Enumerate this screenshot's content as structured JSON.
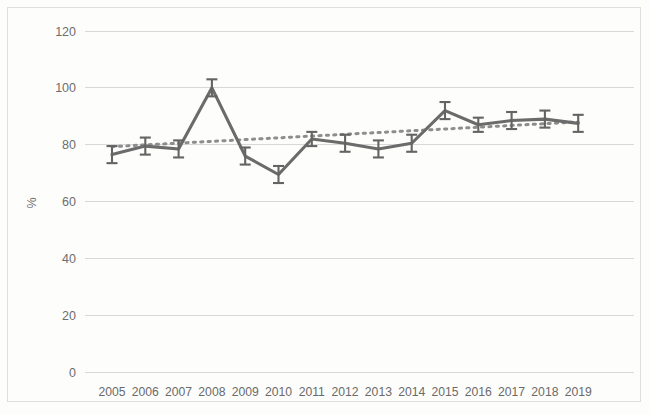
{
  "chart_data": {
    "type": "line",
    "title": "",
    "xlabel": "",
    "ylabel": "%",
    "categories": [
      "2005",
      "2006",
      "2007",
      "2008",
      "2009",
      "2010",
      "2011",
      "2012",
      "2013",
      "2014",
      "2015",
      "2016",
      "2017",
      "2018",
      "2019"
    ],
    "series": [
      {
        "name": "Observed value",
        "values": [
          76.5,
          79.5,
          78.5,
          100.0,
          76.0,
          69.5,
          82.0,
          80.5,
          78.5,
          80.5,
          92.0,
          87.0,
          88.5,
          89.0,
          87.5
        ],
        "error_low": [
          73.5,
          76.5,
          75.5,
          97.0,
          73.0,
          66.5,
          79.5,
          77.5,
          75.5,
          77.5,
          89.0,
          84.5,
          85.5,
          86.0,
          84.5
        ],
        "error_high": [
          79.5,
          82.5,
          81.5,
          103.0,
          79.0,
          72.5,
          84.5,
          83.5,
          81.5,
          83.5,
          95.0,
          89.5,
          91.5,
          92.0,
          90.5
        ],
        "color": "#6b6b6b",
        "style": "solid-with-error-bars"
      },
      {
        "name": "Trend line",
        "values": [
          79.3,
          79.9,
          80.5,
          81.2,
          81.8,
          82.4,
          83.0,
          83.7,
          84.3,
          84.9,
          85.5,
          86.2,
          86.8,
          87.4,
          88.0
        ],
        "color": "#8d8d8d",
        "style": "dotted"
      }
    ],
    "ylim": [
      0,
      120
    ],
    "ytick_labels": [
      "0",
      "20",
      "40",
      "60",
      "80",
      "100",
      "120"
    ],
    "ytick_values": [
      0,
      20,
      40,
      60,
      80,
      100,
      120
    ],
    "grid": "horizontal",
    "legend": "none",
    "frame": "outer-box"
  },
  "axes": {
    "y_title": "%",
    "y_ticks": [
      "120",
      "100",
      "80",
      "60",
      "40",
      "20",
      "0"
    ],
    "x_ticks": [
      "2005",
      "2006",
      "2007",
      "2008",
      "2009",
      "2010",
      "2011",
      "2012",
      "2013",
      "2014",
      "2015",
      "2016",
      "2017",
      "2018",
      "2019"
    ]
  },
  "colors": {
    "series": "#6b6b6b",
    "trend": "#8d8d8d",
    "grid": "#d8d8d8",
    "frame": "#dedede",
    "text": "#6d6d6d",
    "background": "#fdfdfc"
  }
}
